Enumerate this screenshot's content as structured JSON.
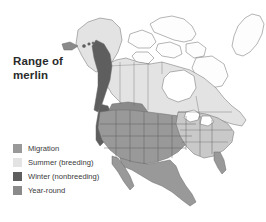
{
  "figure": {
    "kind": "range-map",
    "background_color": "#ffffff",
    "width": 266,
    "height": 222
  },
  "title": {
    "line1": "Range of",
    "line2": "merlin"
  },
  "legend": {
    "items": [
      {
        "label": "Migration",
        "color": "#999999",
        "swatch_name": "migration"
      },
      {
        "label": "Summer (breeding)",
        "color": "#e3e3e3",
        "swatch_name": "summer-breeding"
      },
      {
        "label": "Winter (nonbreeding)",
        "color": "#5e5e5e",
        "swatch_name": "winter-nonbreeding"
      },
      {
        "label": "Year-round",
        "color": "#8a8a8a",
        "swatch_name": "year-round"
      }
    ]
  },
  "map": {
    "region": "North America",
    "land_outline_color": "#6b6b6b",
    "water_color": "#ffffff",
    "unshaded_land_color": "#fdfdfd",
    "areas": [
      {
        "name": "alaska",
        "fill": "#e3e3e3"
      },
      {
        "name": "alaska-coastal-strip",
        "fill": "#5e5e5e"
      },
      {
        "name": "aleutian-islands",
        "fill": "#8a8a8a"
      },
      {
        "name": "canada-boreal",
        "fill": "#e3e3e3"
      },
      {
        "name": "canada-arctic-islands",
        "fill": "#fdfdfd"
      },
      {
        "name": "greenland",
        "fill": "#fdfdfd"
      },
      {
        "name": "hudson-bay",
        "fill": "#ffffff"
      },
      {
        "name": "western-united-states",
        "fill": "#999999"
      },
      {
        "name": "northern-rockies-yearround",
        "fill": "#8a8a8a"
      },
      {
        "name": "pacific-northwest-coast",
        "fill": "#5e5e5e"
      },
      {
        "name": "great-plains",
        "fill": "#999999"
      },
      {
        "name": "eastern-united-states",
        "fill": "#c9c9c9"
      },
      {
        "name": "mexico",
        "fill": "#999999"
      },
      {
        "name": "baja-california",
        "fill": "#999999"
      },
      {
        "name": "florida",
        "fill": "#999999"
      },
      {
        "name": "great-lakes",
        "fill": "#ffffff"
      }
    ]
  }
}
